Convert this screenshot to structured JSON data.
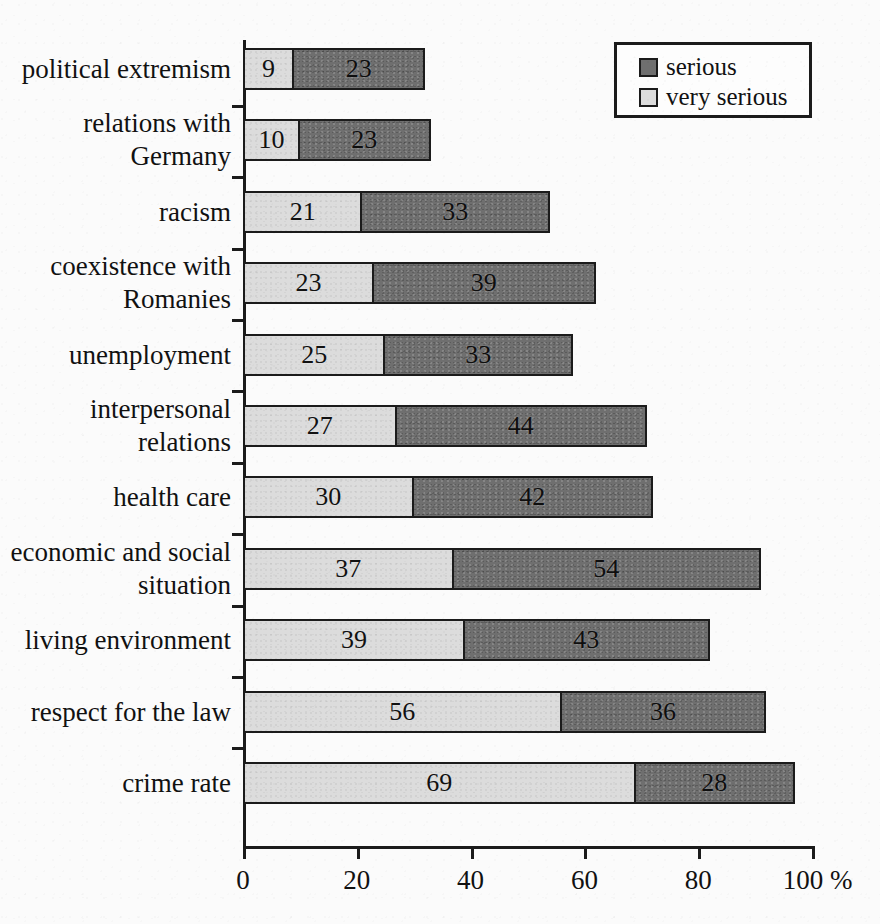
{
  "chart_data": {
    "type": "bar",
    "orientation": "horizontal",
    "stacked": true,
    "title": "",
    "xlabel": "%",
    "ylabel": "",
    "xlim": [
      0,
      100
    ],
    "grid": false,
    "legend_position": "top-right",
    "categories": [
      "political extremism",
      "relations with\nGermany",
      "racism",
      "coexistence with\nRomanies",
      "unemployment",
      "interpersonal\nrelations",
      "health care",
      "economic and social\nsituation",
      "living environment",
      "respect for the law",
      "crime rate"
    ],
    "series": [
      {
        "name": "very serious",
        "color": "#dcdcdc",
        "values": [
          9,
          10,
          21,
          23,
          25,
          27,
          30,
          37,
          39,
          56,
          69
        ]
      },
      {
        "name": "serious",
        "color": "#6f6f6f",
        "values": [
          23,
          23,
          33,
          39,
          33,
          44,
          42,
          54,
          43,
          36,
          28
        ]
      }
    ],
    "totals": [
      32,
      33,
      54,
      62,
      58,
      71,
      72,
      91,
      82,
      92,
      97
    ],
    "xticks": [
      0,
      20,
      40,
      60,
      80,
      100
    ],
    "xtick_labels": [
      "0",
      "20",
      "40",
      "60",
      "80",
      "100 %"
    ]
  },
  "legend": {
    "entries": [
      {
        "label": "serious",
        "swatch": "#6f6f6f"
      },
      {
        "label": "very serious",
        "swatch": "#dcdcdc"
      }
    ]
  }
}
